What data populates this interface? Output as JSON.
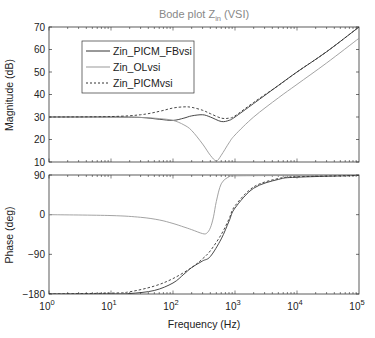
{
  "chart_data": [
    {
      "type": "line",
      "title": "Bode plot Z_in (VSI)",
      "title_main": "Bode plot Z",
      "title_sub": "in",
      "title_suffix": " (VSI)",
      "xlabel": "",
      "ylabel": "Magnitude (dB)",
      "xscale": "log",
      "xlim": [
        1,
        100000
      ],
      "ylim": [
        10,
        70
      ],
      "yticks": [
        10,
        20,
        30,
        40,
        50,
        60,
        70
      ],
      "grid": false,
      "legend_position": "upper-left",
      "series": [
        {
          "name": "Zin_PICM_FBvsi",
          "style": "solid",
          "color": "#333333",
          "x": [
            1,
            10,
            30,
            60,
            100,
            150,
            200,
            300,
            400,
            600,
            800,
            1000,
            2000,
            5000,
            10000,
            30000,
            100000
          ],
          "y": [
            30,
            30,
            29.8,
            29,
            28.5,
            29.5,
            30.5,
            31,
            30,
            28,
            28.5,
            30,
            36,
            44,
            50,
            59,
            70
          ]
        },
        {
          "name": "Zin_OLvsi",
          "style": "solid",
          "color": "#999999",
          "x": [
            1,
            10,
            30,
            60,
            100,
            150,
            200,
            300,
            400,
            500,
            600,
            800,
            1000,
            2000,
            5000,
            10000,
            30000,
            100000
          ],
          "y": [
            30,
            30,
            29.8,
            29.3,
            28.5,
            26.5,
            24,
            18,
            13,
            10.5,
            13,
            18.5,
            22,
            30,
            38.5,
            44.5,
            54,
            65
          ]
        },
        {
          "name": "Zin_PICMvsi",
          "style": "dashed",
          "color": "#333333",
          "x": [
            1,
            10,
            30,
            60,
            100,
            150,
            200,
            300,
            400,
            600,
            800,
            1000,
            2000,
            5000,
            10000,
            30000,
            100000
          ],
          "y": [
            30,
            30.2,
            31,
            32.5,
            34,
            34.5,
            34.3,
            33,
            31.5,
            29.5,
            29.5,
            30.5,
            36.5,
            44,
            50,
            59,
            70
          ]
        }
      ]
    },
    {
      "type": "line",
      "xlabel": "Frequency (Hz)",
      "ylabel": "Phase (deg)",
      "xscale": "log",
      "xlim": [
        1,
        100000
      ],
      "ylim": [
        -180,
        90
      ],
      "yticks": [
        -180,
        -90,
        0,
        90
      ],
      "xticks": [
        "10^0",
        "10^1",
        "10^2",
        "10^3",
        "10^4",
        "10^5"
      ],
      "grid": false,
      "series": [
        {
          "name": "Zin_PICM_FBvsi",
          "style": "solid",
          "color": "#333333",
          "x": [
            1,
            10,
            20,
            50,
            100,
            150,
            200,
            300,
            400,
            600,
            800,
            1000,
            2000,
            5000,
            10000,
            100000
          ],
          "y": [
            -180,
            -180,
            -179,
            -172,
            -155,
            -135,
            -120,
            -105,
            -95,
            -55,
            -15,
            15,
            60,
            80,
            85,
            89
          ]
        },
        {
          "name": "Zin_OLvsi",
          "style": "solid",
          "color": "#999999",
          "x": [
            1,
            10,
            30,
            60,
            100,
            150,
            200,
            300,
            350,
            400,
            450,
            500,
            600,
            800,
            1000,
            10000,
            100000
          ],
          "y": [
            0,
            -2,
            -6,
            -12,
            -20,
            -28,
            -34,
            -43,
            -42,
            -30,
            -5,
            30,
            70,
            86,
            88,
            89,
            90
          ]
        },
        {
          "name": "Zin_PICMvsi",
          "style": "dashed",
          "color": "#333333",
          "x": [
            1,
            10,
            20,
            50,
            100,
            200,
            300,
            400,
            600,
            800,
            1000,
            2000,
            5000,
            10000,
            100000
          ],
          "y": [
            -180,
            -178,
            -175,
            -162,
            -145,
            -120,
            -100,
            -82,
            -45,
            -10,
            20,
            63,
            82,
            86,
            89
          ]
        }
      ]
    }
  ],
  "legend": {
    "items": [
      {
        "label": "Zin_PICM_FBvsi",
        "style": "solid",
        "color": "#333333"
      },
      {
        "label": "Zin_OLvsi",
        "style": "solid",
        "color": "#999999"
      },
      {
        "label": "Zin_PICMvsi",
        "style": "dashed",
        "color": "#333333"
      }
    ]
  },
  "labels": {
    "mag_ticks": [
      "70",
      "60",
      "50",
      "40",
      "30",
      "20",
      "10"
    ],
    "phase_ticks": [
      "90",
      "0",
      "−90",
      "−180"
    ],
    "x_base": "10",
    "x_exps": [
      "0",
      "1",
      "2",
      "3",
      "4",
      "5"
    ]
  }
}
